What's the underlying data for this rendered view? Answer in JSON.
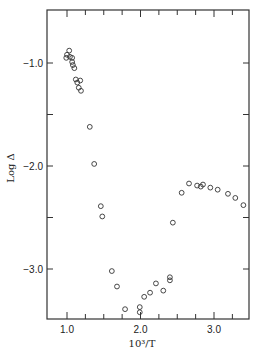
{
  "chart_data": {
    "type": "scatter",
    "title": "",
    "xlabel": "10³/T",
    "ylabel": "Log Δ",
    "xlim": [
      0.75,
      3.5
    ],
    "ylim": [
      -3.5,
      -0.45
    ],
    "xticks": [
      1.0,
      2.0,
      3.0
    ],
    "xtick_labels": [
      "1.0",
      "2.0",
      "3.0"
    ],
    "yticks": [
      -1.0,
      -2.0,
      -3.0
    ],
    "ytick_labels": [
      "−1.0",
      "−2.0",
      "−3.0"
    ],
    "grid": false,
    "legend": null,
    "marker": "open-circle",
    "series": [
      {
        "name": "data",
        "points": [
          [
            1.03,
            -0.88
          ],
          [
            1.0,
            -0.92
          ],
          [
            0.99,
            -0.95
          ],
          [
            1.04,
            -0.94
          ],
          [
            1.07,
            -0.95
          ],
          [
            1.07,
            -0.99
          ],
          [
            1.08,
            -1.02
          ],
          [
            1.1,
            -1.05
          ],
          [
            1.12,
            -1.16
          ],
          [
            1.14,
            -1.19
          ],
          [
            1.18,
            -1.17
          ],
          [
            1.16,
            -1.24
          ],
          [
            1.19,
            -1.27
          ],
          [
            1.31,
            -1.62
          ],
          [
            1.37,
            -1.98
          ],
          [
            1.46,
            -2.39
          ],
          [
            1.48,
            -2.49
          ],
          [
            1.61,
            -3.02
          ],
          [
            1.68,
            -3.17
          ],
          [
            1.79,
            -3.39
          ],
          [
            1.99,
            -3.37
          ],
          [
            1.99,
            -3.42
          ],
          [
            2.05,
            -3.27
          ],
          [
            2.13,
            -3.23
          ],
          [
            2.21,
            -3.14
          ],
          [
            2.31,
            -3.21
          ],
          [
            2.4,
            -3.11
          ],
          [
            2.4,
            -3.08
          ],
          [
            2.44,
            -2.55
          ],
          [
            2.56,
            -2.26
          ],
          [
            2.66,
            -2.17
          ],
          [
            2.77,
            -2.19
          ],
          [
            2.82,
            -2.2
          ],
          [
            2.85,
            -2.18
          ],
          [
            2.95,
            -2.21
          ],
          [
            3.05,
            -2.23
          ],
          [
            3.19,
            -2.27
          ],
          [
            3.29,
            -2.31
          ],
          [
            3.4,
            -2.38
          ]
        ]
      }
    ]
  }
}
